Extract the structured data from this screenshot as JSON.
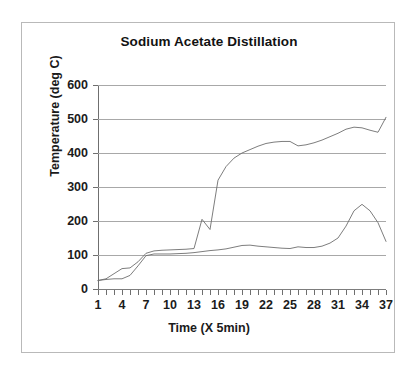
{
  "figure": {
    "title": "Sodium Acetate Distillation",
    "background": "#ffffff",
    "border_color": "#b9b9b9",
    "line_color": "#6e6e6e",
    "grid_color": "#a8a8a8"
  },
  "chart_data": {
    "type": "line",
    "title": "Sodium Acetate Distillation",
    "xlabel": "Time (X 5min)",
    "ylabel": "Temperature (deg C)",
    "xlim": [
      1,
      37
    ],
    "ylim": [
      0,
      600
    ],
    "yticks": [
      0,
      100,
      200,
      300,
      400,
      500,
      600
    ],
    "ytick_labels": [
      "0",
      "100",
      "200",
      "300",
      "400",
      "500",
      "600"
    ],
    "xticks": [
      1,
      2,
      3,
      4,
      5,
      6,
      7,
      8,
      9,
      10,
      11,
      12,
      13,
      14,
      15,
      16,
      17,
      18,
      19,
      20,
      21,
      22,
      23,
      24,
      25,
      26,
      27,
      28,
      29,
      30,
      31,
      32,
      33,
      34,
      35,
      36,
      37
    ],
    "xtick_labels_shown": [
      "1",
      "4",
      "7",
      "10",
      "13",
      "16",
      "19",
      "22",
      "25",
      "28",
      "31",
      "34",
      "37"
    ],
    "xtick_label_positions": [
      1,
      4,
      7,
      10,
      13,
      16,
      19,
      22,
      25,
      28,
      31,
      34,
      37
    ],
    "grid": "horizontal",
    "legend": "none",
    "x": [
      1,
      2,
      3,
      4,
      5,
      6,
      7,
      8,
      9,
      10,
      11,
      12,
      13,
      14,
      15,
      16,
      17,
      18,
      19,
      20,
      21,
      22,
      23,
      24,
      25,
      26,
      27,
      28,
      29,
      30,
      31,
      32,
      33,
      34,
      35,
      36,
      37
    ],
    "series": [
      {
        "name": "upper-curve",
        "values": [
          25,
          30,
          45,
          60,
          62,
          80,
          105,
          112,
          114,
          115,
          116,
          117,
          119,
          205,
          175,
          320,
          360,
          385,
          400,
          410,
          420,
          428,
          432,
          434,
          434,
          421,
          424,
          430,
          438,
          448,
          458,
          470,
          476,
          474,
          467,
          461,
          505
        ]
      },
      {
        "name": "lower-curve",
        "values": [
          25,
          28,
          30,
          30,
          40,
          68,
          98,
          103,
          103,
          103,
          104,
          105,
          107,
          110,
          113,
          115,
          118,
          123,
          128,
          129,
          126,
          124,
          122,
          120,
          119,
          124,
          122,
          122,
          126,
          135,
          150,
          185,
          230,
          249,
          230,
          195,
          140
        ]
      }
    ]
  }
}
